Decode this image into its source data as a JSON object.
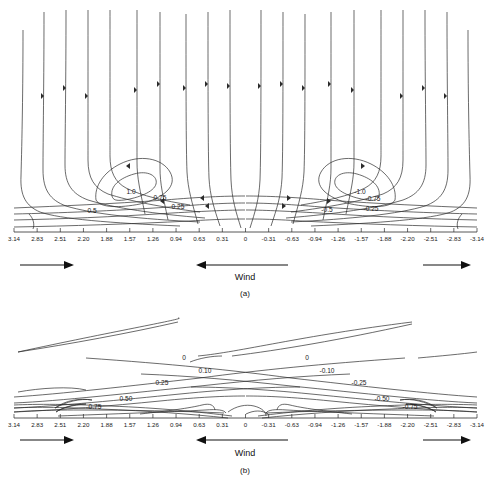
{
  "figure": {
    "title": "",
    "background": "#ffffff",
    "line_color": "#2b2b2b",
    "panels": [
      "(a)",
      "(b)"
    ]
  },
  "panel_a": {
    "label": "(a)",
    "wind_label": "Wind",
    "wind_center_direction": "left",
    "wind_left_direction": "right",
    "wind_right_direction": "right"
  },
  "panel_b": {
    "label": "(b)",
    "wind_label": "Wind",
    "wind_center_direction": "left",
    "wind_left_direction": "right",
    "wind_right_direction": "right"
  },
  "axis": {
    "tick_labels": [
      "3.14",
      "2.83",
      "2.51",
      "2.20",
      "1.88",
      "1.57",
      "1.26",
      "0.94",
      "0.63",
      "0.31",
      "0",
      "-0.31",
      "-0.63",
      "-0.94",
      "-1.26",
      "-1.57",
      "-1.88",
      "-2.20",
      "-2.51",
      "-2.83",
      "-3.14"
    ],
    "tick_values": [
      3.14,
      2.83,
      2.51,
      2.2,
      1.88,
      1.57,
      1.26,
      0.94,
      0.63,
      0.31,
      0,
      -0.31,
      -0.63,
      -0.94,
      -1.26,
      -1.57,
      -1.88,
      -2.2,
      -2.51,
      -2.83,
      -3.14
    ],
    "xlabel": "",
    "xlim": [
      3.14,
      -3.14
    ]
  },
  "chart_data": {
    "type": "line",
    "title": "",
    "subtitle": "",
    "xlabel": "",
    "ylabel": "",
    "grid": false,
    "legend": "none",
    "x": [
      3.14,
      2.83,
      2.51,
      2.2,
      1.88,
      1.57,
      1.26,
      0.94,
      0.63,
      0.31,
      0,
      -0.31,
      -0.63,
      -0.94,
      -1.26,
      -1.57,
      -1.88,
      -2.2,
      -2.51,
      -2.83,
      -3.14
    ],
    "xlim": [
      3.14,
      -3.14
    ],
    "panels": [
      {
        "name": "(a)",
        "type": "contour",
        "contour_levels": [
          1.0,
          0.75,
          0.5,
          0.25,
          -0.25,
          -0.5,
          -0.75,
          -1.0
        ],
        "contour_labels": [
          "1.0",
          "0.75",
          "0.5",
          "0.25",
          "-0.25",
          "-0.5",
          "-0.75",
          "-1.0"
        ],
        "description": "Near-vertical contour lines in the upper field turning sharply to near-horizontal near the lower boundary; two closed elliptical cells centered near x = 1.6 and x = -1.6 enclosing the 1.0 and -1.0 contours.",
        "closed_cells": [
          {
            "label": "1.0",
            "center_x": 1.6,
            "sign": "positive"
          },
          {
            "label": "-1.0",
            "center_x": -1.6,
            "sign": "negative"
          }
        ],
        "labeled_contours_left": [
          "1.0",
          "0.75",
          "0.5",
          "0.25"
        ],
        "labeled_contours_right": [
          "-1.0",
          "-0.75",
          "-0.5",
          "-0.25"
        ],
        "has_direction_arrowheads": true
      },
      {
        "name": "(b)",
        "type": "contour",
        "contour_levels": [
          0.75,
          0.5,
          0.25,
          0.1,
          0.0,
          -0.1,
          -0.25,
          -0.5,
          -0.75
        ],
        "contour_labels": [
          "0.75",
          "0.50",
          "0.25",
          "0.10",
          "0",
          "-0.10",
          "-0.25",
          "-0.50",
          "-0.75"
        ],
        "description": "Gently sloping, nearly linear contours rising from lower-left to upper-right, bunched near the lower boundary; zero contour crosses the mid-field twice.",
        "labeled_contours_left": [
          "0",
          "0.10",
          "0.25",
          "0.50",
          "0.75"
        ],
        "labeled_contours_right": [
          "0",
          "-0.10",
          "-0.25",
          "-0.50",
          "-0.75"
        ],
        "has_direction_arrowheads": false
      }
    ]
  }
}
